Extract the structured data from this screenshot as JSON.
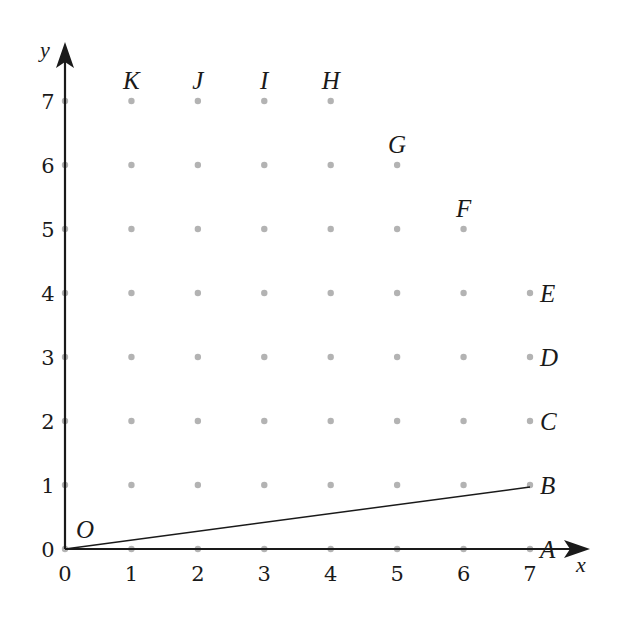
{
  "diagram": {
    "axes": {
      "x_label": "x",
      "y_label": "y",
      "x_ticks": [
        "0",
        "1",
        "2",
        "3",
        "4",
        "5",
        "6",
        "7"
      ],
      "y_ticks": [
        "0",
        "1",
        "2",
        "3",
        "4",
        "5",
        "6",
        "7"
      ]
    },
    "origin_label": "O",
    "points": [
      {
        "label": "A",
        "x": 7,
        "y": 0
      },
      {
        "label": "B",
        "x": 7,
        "y": 1
      },
      {
        "label": "C",
        "x": 7,
        "y": 2
      },
      {
        "label": "D",
        "x": 7,
        "y": 3
      },
      {
        "label": "E",
        "x": 7,
        "y": 4
      },
      {
        "label": "F",
        "x": 6,
        "y": 5
      },
      {
        "label": "G",
        "x": 5,
        "y": 6
      },
      {
        "label": "H",
        "x": 4,
        "y": 7
      },
      {
        "label": "I",
        "x": 3,
        "y": 7
      },
      {
        "label": "J",
        "x": 2,
        "y": 7
      },
      {
        "label": "K",
        "x": 1,
        "y": 7
      }
    ],
    "segment": {
      "from": "O",
      "to": "B"
    },
    "grid_rows_max_x": {
      "0": 7,
      "1": 7,
      "2": 7,
      "3": 7,
      "4": 7,
      "5": 6,
      "6": 5,
      "7": 4
    },
    "colors": {
      "dot": "#b3b3b3",
      "ink": "#1a1a1a"
    }
  }
}
